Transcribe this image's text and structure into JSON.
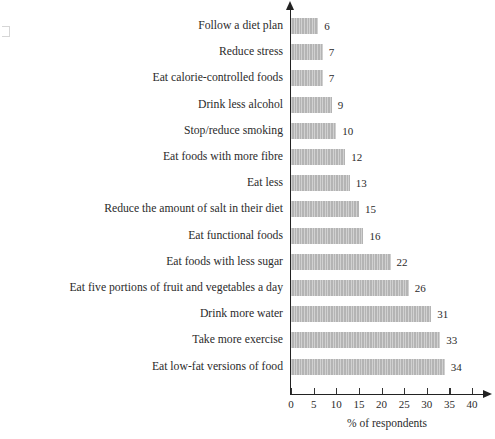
{
  "chart_data": {
    "type": "bar",
    "orientation": "horizontal",
    "title": "",
    "subtitle": "",
    "xlabel": "% of respondents",
    "ylabel": "",
    "xlim": [
      0,
      40
    ],
    "xticks": [
      0,
      5,
      10,
      15,
      20,
      25,
      30,
      35,
      40
    ],
    "grid": false,
    "legend": null,
    "bar_color": "#b4b4b4",
    "axis_color": "#222222",
    "text_color": "#2b2b2b",
    "categories": [
      "Follow a diet plan",
      "Reduce stress",
      "Eat calorie-controlled foods",
      "Drink less alcohol",
      "Stop/reduce smoking",
      "Eat foods with more fibre",
      "Eat less",
      "Reduce the amount of salt in their diet",
      "Eat functional foods",
      "Eat foods with less sugar",
      "Eat five portions of fruit and vegetables a day",
      "Drink more water",
      "Take more exercise",
      "Eat low-fat versions of food"
    ],
    "values": [
      6,
      7,
      7,
      9,
      10,
      12,
      13,
      15,
      16,
      22,
      26,
      31,
      33,
      34
    ],
    "value_labels": [
      "6",
      "7",
      "7",
      "9",
      "10",
      "12",
      "13",
      "15",
      "16",
      "22",
      "26",
      "31",
      "33",
      "34"
    ]
  }
}
